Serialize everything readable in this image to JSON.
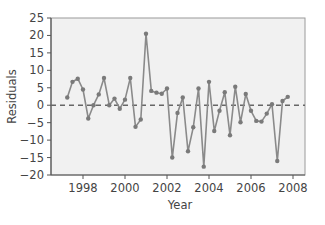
{
  "chart_data": {
    "type": "line",
    "title": "",
    "xlabel": "Year",
    "ylabel": "Residuals",
    "xlim": [
      1996.8,
      2008.6
    ],
    "ylim": [
      -20,
      25
    ],
    "x_ticks": [
      1998,
      2000,
      2002,
      2004,
      2006,
      2008
    ],
    "x_tick_labels": [
      "1998",
      "2000",
      "2002",
      "2004",
      "2006",
      "2008"
    ],
    "y_ticks": [
      25,
      20,
      15,
      10,
      5,
      0,
      -5,
      -10,
      -15,
      -20
    ],
    "y_tick_labels": [
      "25",
      "20",
      "15",
      "10",
      "5",
      "0",
      "−5",
      "−10",
      "−15",
      "−20"
    ],
    "grid": false,
    "legend": null,
    "reference_line": {
      "y": 0,
      "style": "dashed"
    },
    "series": [
      {
        "name": "Residuals",
        "x": [
          1997.25,
          1997.5,
          1997.75,
          1998.0,
          1998.25,
          1998.5,
          1998.75,
          1999.0,
          1999.25,
          1999.5,
          1999.75,
          2000.0,
          2000.25,
          2000.5,
          2000.75,
          2001.0,
          2001.25,
          2001.5,
          2001.75,
          2002.0,
          2002.25,
          2002.5,
          2002.75,
          2003.0,
          2003.25,
          2003.5,
          2003.75,
          2004.0,
          2004.25,
          2004.5,
          2004.75,
          2005.0,
          2005.25,
          2005.5,
          2005.75,
          2006.0,
          2006.25,
          2006.5,
          2006.75,
          2007.0,
          2007.25,
          2007.5,
          2007.75
        ],
        "values": [
          2.2,
          6.7,
          7.6,
          4.5,
          -3.8,
          0.0,
          3.1,
          7.8,
          0.0,
          1.9,
          -1.0,
          1.6,
          7.8,
          -6.2,
          -4.1,
          20.5,
          4.1,
          3.6,
          3.3,
          4.8,
          -15.0,
          -2.2,
          2.2,
          -13.2,
          -6.3,
          4.8,
          -17.6,
          6.7,
          -7.4,
          -1.6,
          3.7,
          -8.6,
          5.3,
          -4.9,
          3.2,
          -1.6,
          -4.5,
          -4.7,
          -2.4,
          0.3,
          -16.0,
          1.2,
          2.4
        ]
      }
    ],
    "colors": {
      "line": "#8a8a8a",
      "marker": "#7a7a7a",
      "plot_background": "#f1f1f1",
      "axis": "#555555",
      "reference_line": "#666666"
    }
  }
}
